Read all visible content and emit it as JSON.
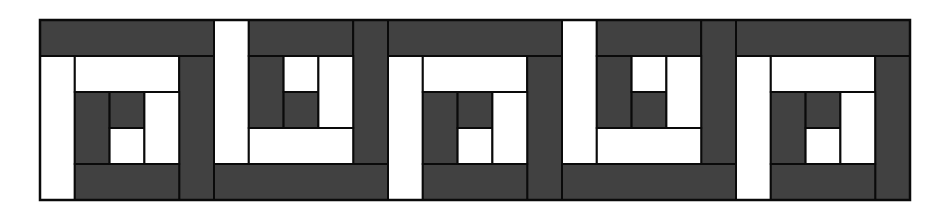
{
  "colors": {
    "dark": "#414141",
    "light": "#ffffff",
    "stroke": "#0a0a0a",
    "background": "#ffffff"
  },
  "grid": {
    "origin_x": 40,
    "origin_y": 20,
    "block_width": 174,
    "block_height": 180,
    "units": 5
  },
  "block_types": {
    "A": [
      {
        "c": 0,
        "r": 0,
        "w": 5,
        "h": 1,
        "fill": "dark",
        "name": "top-log"
      },
      {
        "c": 0,
        "r": 1,
        "w": 1,
        "h": 4,
        "fill": "light",
        "name": "left-log"
      },
      {
        "c": 1,
        "r": 1,
        "w": 3,
        "h": 1,
        "fill": "light",
        "name": "inner-top-log"
      },
      {
        "c": 4,
        "r": 1,
        "w": 1,
        "h": 4,
        "fill": "dark",
        "name": "right-log"
      },
      {
        "c": 1,
        "r": 4,
        "w": 3,
        "h": 1,
        "fill": "dark",
        "name": "bottom-log"
      },
      {
        "c": 1,
        "r": 2,
        "w": 1,
        "h": 2,
        "fill": "dark",
        "name": "inner-left-log"
      },
      {
        "c": 2,
        "r": 2,
        "w": 1,
        "h": 1,
        "fill": "dark",
        "name": "center-dark-square"
      },
      {
        "c": 2,
        "r": 3,
        "w": 1,
        "h": 1,
        "fill": "light",
        "name": "center-light-square"
      },
      {
        "c": 3,
        "r": 2,
        "w": 1,
        "h": 2,
        "fill": "light",
        "name": "inner-right-log"
      }
    ],
    "B": [
      {
        "c": 0,
        "r": 0,
        "w": 1,
        "h": 4,
        "fill": "light",
        "name": "left-log"
      },
      {
        "c": 1,
        "r": 0,
        "w": 3,
        "h": 1,
        "fill": "dark",
        "name": "top-log"
      },
      {
        "c": 4,
        "r": 0,
        "w": 1,
        "h": 4,
        "fill": "dark",
        "name": "right-log"
      },
      {
        "c": 0,
        "r": 4,
        "w": 5,
        "h": 1,
        "fill": "dark",
        "name": "bottom-log"
      },
      {
        "c": 1,
        "r": 1,
        "w": 1,
        "h": 2,
        "fill": "dark",
        "name": "inner-left-log"
      },
      {
        "c": 2,
        "r": 1,
        "w": 1,
        "h": 1,
        "fill": "light",
        "name": "center-light-square"
      },
      {
        "c": 2,
        "r": 2,
        "w": 1,
        "h": 1,
        "fill": "dark",
        "name": "center-dark-square"
      },
      {
        "c": 3,
        "r": 1,
        "w": 1,
        "h": 2,
        "fill": "light",
        "name": "inner-right-log"
      },
      {
        "c": 1,
        "r": 3,
        "w": 3,
        "h": 1,
        "fill": "light",
        "name": "inner-bottom-log"
      }
    ]
  },
  "blocks": [
    "A",
    "B",
    "A",
    "B",
    "A"
  ]
}
